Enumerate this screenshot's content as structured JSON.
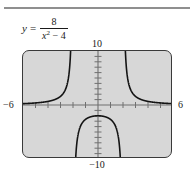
{
  "figure": {
    "name": "graph-figure",
    "equation": {
      "lhs": "y",
      "equals": "=",
      "numerator": "8",
      "denominator_base": "x",
      "denominator_exponent": "2",
      "denominator_rest": "− 4",
      "plain": "y = 8/(x² − 4)"
    },
    "labels": {
      "top": "10",
      "bottom": "−10",
      "left": "−6",
      "right": "6"
    },
    "colors": {
      "plot_background": "#d7d7d7",
      "plot_border": "#3a3a3a",
      "curve": "#1a1a1a",
      "axis": "#6e6e6e",
      "rule": "#8f8f8f",
      "page_background": "#ffffff"
    }
  },
  "chart_data": {
    "type": "line",
    "title": "",
    "subtitle": "",
    "xlabel": "",
    "ylabel": "",
    "function": "y = 8 / (x^2 - 4)",
    "xlim": [
      -6,
      6
    ],
    "ylim": [
      -10,
      10
    ],
    "x_axis_labels": {
      "min": "−6",
      "max": "6"
    },
    "y_axis_labels": {
      "min": "−10",
      "max": "10"
    },
    "grid": false,
    "legend": null,
    "x_tick_step": 1,
    "y_tick_step": 1,
    "vertical_asymptotes": [
      -2,
      2
    ],
    "horizontal_asymptote": 0,
    "y_intercept": -2,
    "series": [
      {
        "name": "left-branch",
        "x_range": [
          -6,
          -2
        ],
        "points": [
          [
            -6.0,
            0.25
          ],
          [
            -5.5,
            0.3
          ],
          [
            -5.0,
            0.381
          ],
          [
            -4.5,
            0.494
          ],
          [
            -4.0,
            0.667
          ],
          [
            -3.5,
            0.941
          ],
          [
            -3.0,
            1.6
          ],
          [
            -2.8,
            2.105
          ],
          [
            -2.6,
            2.963
          ],
          [
            -2.4,
            4.545
          ],
          [
            -2.3,
            5.797
          ],
          [
            -2.2,
            7.619
          ],
          [
            -2.15,
            9.005
          ],
          [
            -2.12,
            10.0
          ]
        ]
      },
      {
        "name": "middle-branch",
        "x_range": [
          -2,
          2
        ],
        "points": [
          [
            -1.88,
            -10.0
          ],
          [
            -1.9,
            -10.26
          ],
          [
            -1.8,
            -7.018
          ],
          [
            -1.7,
            -5.405
          ],
          [
            -1.5,
            -4.571
          ],
          [
            -1.2,
            -3.175
          ],
          [
            -1.0,
            -2.667
          ],
          [
            -0.5,
            -2.133
          ],
          [
            0.0,
            -2.0
          ],
          [
            0.5,
            -2.133
          ],
          [
            1.0,
            -2.667
          ],
          [
            1.2,
            -3.175
          ],
          [
            1.5,
            -4.571
          ],
          [
            1.7,
            -5.405
          ],
          [
            1.8,
            -7.018
          ],
          [
            1.88,
            -10.0
          ]
        ]
      },
      {
        "name": "right-branch",
        "x_range": [
          2,
          6
        ],
        "points": [
          [
            2.12,
            10.0
          ],
          [
            2.15,
            9.005
          ],
          [
            2.2,
            7.619
          ],
          [
            2.3,
            5.797
          ],
          [
            2.4,
            4.545
          ],
          [
            2.6,
            2.963
          ],
          [
            2.8,
            2.105
          ],
          [
            3.0,
            1.6
          ],
          [
            3.5,
            0.941
          ],
          [
            4.0,
            0.667
          ],
          [
            4.5,
            0.494
          ],
          [
            5.0,
            0.381
          ],
          [
            5.5,
            0.3
          ],
          [
            6.0,
            0.25
          ]
        ]
      }
    ]
  }
}
